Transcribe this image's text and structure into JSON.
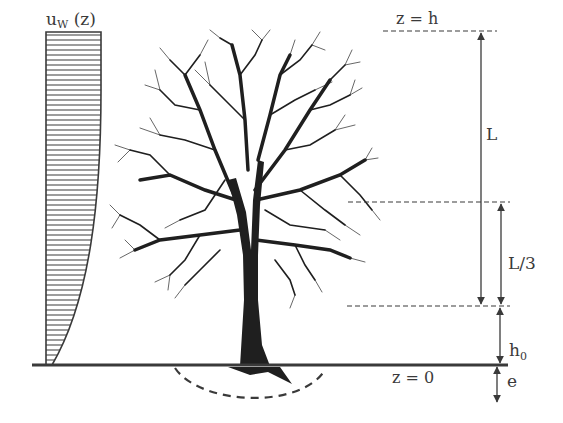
{
  "figure": {
    "type": "tree-wind-loading-schematic",
    "colors": {
      "ink": "#3a3a3a",
      "tree": "#1f1f1f",
      "background": "#ffffff"
    }
  },
  "labels": {
    "wind_profile": "u",
    "wind_profile_sub": "W",
    "wind_profile_arg": " (z)",
    "top_level": "z = h",
    "ground_level": "z = 0",
    "crown_length": "L",
    "crown_third": "L/3",
    "stem_base_height": "h",
    "stem_base_height_sub": "0",
    "anchorage_depth": "e"
  },
  "levels": {
    "z_h_y": 31,
    "crown_third_top_y": 202,
    "crown_base_y": 306,
    "ground_y": 365
  },
  "elements": [
    "wind velocity profile u_W(z) hatched area",
    "tree silhouette",
    "root plate dashed arc",
    "ground line z = 0",
    "dimension L from z = h to crown base",
    "dimension L/3 at lower third of crown",
    "dimension h0 from ground to crown base",
    "dimension e below ground"
  ]
}
